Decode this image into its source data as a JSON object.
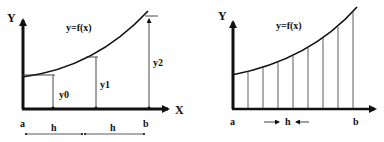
{
  "left_panel": {
    "y_axis_label": "Y",
    "x_axis_label": "X",
    "curve_label": "y=f(x)",
    "ordinates": [
      "y0",
      "y1",
      "y2"
    ],
    "x_start_label": "a",
    "x_end_label": "b",
    "interval_labels": [
      "h",
      "h"
    ]
  },
  "right_panel": {
    "y_axis_label": "Y",
    "curve_label": "y=f(x)",
    "x_start_label": "a",
    "x_end_label": "b",
    "interval_label": "h",
    "strip_count": 8
  },
  "colors": {
    "ink": "#111111",
    "thin_line": "#333333",
    "background": "#ffffff"
  }
}
